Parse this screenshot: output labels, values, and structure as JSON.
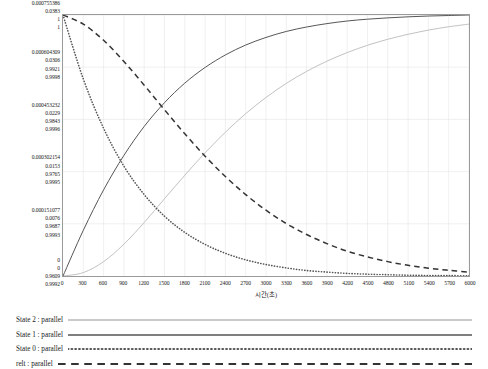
{
  "chart_data": {
    "type": "line",
    "title": "",
    "xlabel": "시간(초)",
    "ylabel": "",
    "xlim": [
      0,
      6000
    ],
    "ylim": [
      0,
      1
    ],
    "grid": true,
    "legend_position": "bottom",
    "x_ticks": [
      "0",
      "300",
      "600",
      "900",
      "1200",
      "1500",
      "1800",
      "2100",
      "2400",
      "2700",
      "3000",
      "3300",
      "3600",
      "3900",
      "4200",
      "4500",
      "4800",
      "5100",
      "5400",
      "5700",
      "6000"
    ],
    "y_tick_rows": [
      {
        "frac": 1.0,
        "values": [
          "0.000755386",
          "0.0383",
          "1",
          "1"
        ]
      },
      {
        "frac": 0.8,
        "values": [
          "0.000604309",
          "0.0306",
          "0.9921",
          "0.9998"
        ]
      },
      {
        "frac": 0.6,
        "values": [
          "0.000453232",
          "0.0229",
          "0.9843",
          "0.9996"
        ]
      },
      {
        "frac": 0.4,
        "values": [
          "0.000302154",
          "0.0153",
          "0.9765",
          "0.9995"
        ]
      },
      {
        "frac": 0.2,
        "values": [
          "0.000151077",
          "0.0076",
          "0.9687",
          "0.9993"
        ]
      },
      {
        "frac": 0.0,
        "values": [
          "0",
          "0",
          "0.9609",
          "0.9992"
        ]
      }
    ],
    "series": [
      {
        "name": "State 2 : parallel",
        "style": "solid-light",
        "color": "#b9b9b9",
        "shape": "rise-slow",
        "x": [
          0,
          300,
          600,
          900,
          1200,
          1500,
          1800,
          2100,
          2400,
          2700,
          3000,
          3300,
          3600,
          3900,
          4200,
          4500,
          4800,
          5100,
          5400,
          5700,
          6000
        ],
        "values": [
          0.0,
          0.013,
          0.055,
          0.122,
          0.205,
          0.296,
          0.386,
          0.472,
          0.551,
          0.622,
          0.684,
          0.738,
          0.784,
          0.823,
          0.856,
          0.884,
          0.907,
          0.926,
          0.942,
          0.955,
          0.965
        ]
      },
      {
        "name": "State 1 : parallel",
        "style": "solid-dark",
        "color": "#555555",
        "shape": "rise-fast",
        "x": [
          0,
          300,
          600,
          900,
          1200,
          1500,
          1800,
          2100,
          2400,
          2700,
          3000,
          3300,
          3600,
          3900,
          4200,
          4500,
          4800,
          5100,
          5400,
          5700,
          6000
        ],
        "values": [
          0.0,
          0.175,
          0.33,
          0.462,
          0.573,
          0.664,
          0.739,
          0.799,
          0.847,
          0.885,
          0.914,
          0.937,
          0.954,
          0.967,
          0.977,
          0.984,
          0.989,
          0.993,
          0.996,
          0.998,
          1.0
        ]
      },
      {
        "name": "State 0 : parallel",
        "style": "dotted",
        "color": "#555555",
        "shape": "decay-fast",
        "x": [
          0,
          300,
          600,
          900,
          1200,
          1500,
          1800,
          2100,
          2400,
          2700,
          3000,
          3300,
          3600,
          3900,
          4200,
          4500,
          4800,
          5100,
          5400,
          5700,
          6000
        ],
        "values": [
          1.0,
          0.755,
          0.566,
          0.421,
          0.312,
          0.229,
          0.167,
          0.121,
          0.087,
          0.062,
          0.044,
          0.031,
          0.021,
          0.015,
          0.01,
          0.007,
          0.005,
          0.003,
          0.002,
          0.0015,
          0.001
        ]
      },
      {
        "name": "relt : parallel",
        "style": "dashed",
        "color": "#333333",
        "shape": "decay-slow",
        "x": [
          0,
          300,
          600,
          900,
          1200,
          1500,
          1800,
          2100,
          2400,
          2700,
          3000,
          3300,
          3600,
          3900,
          4200,
          4500,
          4800,
          5100,
          5400,
          5700,
          6000
        ],
        "values": [
          1.0,
          0.965,
          0.903,
          0.822,
          0.731,
          0.637,
          0.545,
          0.459,
          0.381,
          0.312,
          0.252,
          0.201,
          0.159,
          0.124,
          0.095,
          0.073,
          0.055,
          0.041,
          0.03,
          0.022,
          0.015
        ]
      }
    ]
  },
  "legend": {
    "items": [
      {
        "label": "State 2 : parallel",
        "style": "solid-light",
        "color": "#b9b9b9"
      },
      {
        "label": "State 1 : parallel",
        "style": "solid-dark",
        "color": "#555555"
      },
      {
        "label": "State 0 : parallel",
        "style": "dotted",
        "color": "#555555"
      },
      {
        "label": "relt : parallel",
        "style": "dashed",
        "color": "#333333"
      }
    ]
  }
}
